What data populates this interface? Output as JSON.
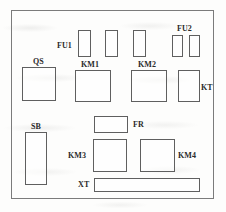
{
  "diagram": {
    "panel": {
      "name": "control-panel-outline",
      "x": 11,
      "y": 10,
      "width": 203,
      "height": 189
    },
    "style": {
      "background_color": "#fdfdfc",
      "panel_border_color": "#7b7b7b",
      "component_border_color": "#5f5f5f",
      "label_color": "#2b2b2b"
    },
    "labels": [
      {
        "id": "FU1",
        "text": "FU1",
        "x": 57,
        "y": 42
      },
      {
        "id": "FU2",
        "text": "FU2",
        "x": 177,
        "y": 25
      },
      {
        "id": "QS",
        "text": "QS",
        "x": 33,
        "y": 58
      },
      {
        "id": "KM1",
        "text": "KM1",
        "x": 81,
        "y": 61
      },
      {
        "id": "KM2",
        "text": "KM2",
        "x": 138,
        "y": 61
      },
      {
        "id": "KT",
        "text": "KT",
        "x": 201,
        "y": 84
      },
      {
        "id": "SB",
        "text": "SB",
        "x": 31,
        "y": 123
      },
      {
        "id": "FR",
        "text": "FR",
        "x": 133,
        "y": 121
      },
      {
        "id": "KM3",
        "text": "KM3",
        "x": 68,
        "y": 152
      },
      {
        "id": "KM4",
        "text": "KM4",
        "x": 178,
        "y": 152
      },
      {
        "id": "XT",
        "text": "XT",
        "x": 78,
        "y": 181
      }
    ],
    "components": [
      {
        "id": "fu1-fuse-1",
        "label": "FU1",
        "x": 78,
        "y": 30,
        "width": 13,
        "height": 27
      },
      {
        "id": "fu1-fuse-2",
        "label": "FU1",
        "x": 105,
        "y": 30,
        "width": 13,
        "height": 27
      },
      {
        "id": "fu1-fuse-3",
        "label": "FU1",
        "x": 133,
        "y": 30,
        "width": 13,
        "height": 27
      },
      {
        "id": "fu2-fuse-1",
        "label": "FU2",
        "x": 172,
        "y": 35,
        "width": 11,
        "height": 22
      },
      {
        "id": "fu2-fuse-2",
        "label": "FU2",
        "x": 189,
        "y": 35,
        "width": 11,
        "height": 22
      },
      {
        "id": "qs-switch",
        "label": "QS",
        "x": 22,
        "y": 67,
        "width": 34,
        "height": 34
      },
      {
        "id": "km1-contactor",
        "label": "KM1",
        "x": 75,
        "y": 70,
        "width": 36,
        "height": 32
      },
      {
        "id": "km2-contactor",
        "label": "KM2",
        "x": 131,
        "y": 70,
        "width": 36,
        "height": 32
      },
      {
        "id": "kt-timer",
        "label": "KT",
        "x": 178,
        "y": 70,
        "width": 22,
        "height": 32
      },
      {
        "id": "fr-relay",
        "label": "FR",
        "x": 94,
        "y": 116,
        "width": 34,
        "height": 17
      },
      {
        "id": "sb-button",
        "label": "SB",
        "x": 25,
        "y": 132,
        "width": 22,
        "height": 53
      },
      {
        "id": "km3-contactor",
        "label": "KM3",
        "x": 93,
        "y": 139,
        "width": 34,
        "height": 33
      },
      {
        "id": "km4-contactor",
        "label": "KM4",
        "x": 140,
        "y": 139,
        "width": 35,
        "height": 33
      },
      {
        "id": "xt-terminal",
        "label": "XT",
        "x": 94,
        "y": 178,
        "width": 106,
        "height": 14
      }
    ]
  }
}
